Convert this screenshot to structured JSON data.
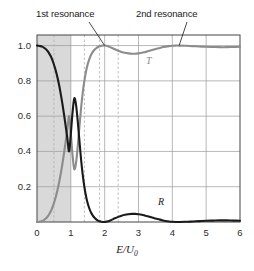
{
  "chart_data": {
    "type": "line",
    "title": "",
    "subtitle": "",
    "xlabel": "E/U_0",
    "xlabel_main": "E/U",
    "xlabel_sub": "0",
    "ylabel": "",
    "xlim": [
      0,
      6
    ],
    "ylim": [
      0,
      1.06
    ],
    "grid": true,
    "grid_x_values": [
      0,
      1,
      2,
      3,
      4,
      5,
      6
    ],
    "grid_y_values": [
      0.2,
      0.4,
      0.6,
      0.8,
      1.0
    ],
    "xticks": [
      0,
      1,
      2,
      3,
      4,
      5,
      6
    ],
    "xtick_labels": [
      "0",
      "1",
      "2",
      "3",
      "4",
      "5",
      "6"
    ],
    "yticks": [
      0.2,
      0.4,
      0.6,
      0.8,
      1.0
    ],
    "ytick_labels": [
      "0.2",
      "0.4",
      "0.6",
      "0.8",
      "1.0"
    ],
    "legend_position": "inline-curve-labels",
    "shaded_region": {
      "label": "bound-region",
      "x_start": 0,
      "x_end": 1,
      "color": "#d9d9d9"
    },
    "dashed_verticals": [
      0.5,
      1.4,
      1.85,
      2.4
    ],
    "series": [
      {
        "name": "T",
        "label": "T",
        "color": "#8c8c8c",
        "points": [
          [
            0.0,
            0.0
          ],
          [
            0.05,
            0.001
          ],
          [
            0.1,
            0.003
          ],
          [
            0.15,
            0.006
          ],
          [
            0.2,
            0.011
          ],
          [
            0.25,
            0.018
          ],
          [
            0.3,
            0.028
          ],
          [
            0.35,
            0.041
          ],
          [
            0.4,
            0.058
          ],
          [
            0.45,
            0.08
          ],
          [
            0.5,
            0.107
          ],
          [
            0.55,
            0.139
          ],
          [
            0.6,
            0.177
          ],
          [
            0.65,
            0.221
          ],
          [
            0.7,
            0.272
          ],
          [
            0.75,
            0.329
          ],
          [
            0.8,
            0.392
          ],
          [
            0.85,
            0.46
          ],
          [
            0.9,
            0.53
          ],
          [
            0.95,
            0.6
          ],
          [
            1.0,
            0.5
          ],
          [
            1.05,
            0.38
          ],
          [
            1.1,
            0.3
          ],
          [
            1.15,
            0.33
          ],
          [
            1.2,
            0.42
          ],
          [
            1.25,
            0.53
          ],
          [
            1.3,
            0.64
          ],
          [
            1.35,
            0.73
          ],
          [
            1.4,
            0.8
          ],
          [
            1.45,
            0.855
          ],
          [
            1.5,
            0.895
          ],
          [
            1.55,
            0.925
          ],
          [
            1.6,
            0.948
          ],
          [
            1.65,
            0.964
          ],
          [
            1.7,
            0.976
          ],
          [
            1.75,
            0.985
          ],
          [
            1.8,
            0.992
          ],
          [
            1.85,
            0.996
          ],
          [
            1.9,
            0.999
          ],
          [
            1.95,
            1.0
          ],
          [
            2.0,
            1.0
          ],
          [
            2.1,
            0.996
          ],
          [
            2.2,
            0.988
          ],
          [
            2.3,
            0.979
          ],
          [
            2.4,
            0.971
          ],
          [
            2.5,
            0.964
          ],
          [
            2.6,
            0.959
          ],
          [
            2.7,
            0.956
          ],
          [
            2.8,
            0.954
          ],
          [
            2.9,
            0.954
          ],
          [
            3.0,
            0.956
          ],
          [
            3.1,
            0.959
          ],
          [
            3.2,
            0.964
          ],
          [
            3.3,
            0.969
          ],
          [
            3.4,
            0.975
          ],
          [
            3.5,
            0.98
          ],
          [
            3.6,
            0.985
          ],
          [
            3.7,
            0.99
          ],
          [
            3.8,
            0.994
          ],
          [
            3.9,
            0.997
          ],
          [
            4.0,
            0.999
          ],
          [
            4.1,
            1.0
          ],
          [
            4.2,
            1.0
          ],
          [
            4.4,
            0.999
          ],
          [
            4.6,
            0.997
          ],
          [
            4.8,
            0.995
          ],
          [
            5.0,
            0.993
          ],
          [
            5.2,
            0.992
          ],
          [
            5.4,
            0.991
          ],
          [
            5.6,
            0.991
          ],
          [
            5.8,
            0.992
          ],
          [
            6.0,
            0.993
          ]
        ]
      },
      {
        "name": "R",
        "label": "R",
        "color": "#1a1a1a",
        "points": [
          [
            0.0,
            1.0
          ],
          [
            0.05,
            0.999
          ],
          [
            0.1,
            0.997
          ],
          [
            0.15,
            0.994
          ],
          [
            0.2,
            0.989
          ],
          [
            0.25,
            0.982
          ],
          [
            0.3,
            0.972
          ],
          [
            0.35,
            0.959
          ],
          [
            0.4,
            0.942
          ],
          [
            0.45,
            0.92
          ],
          [
            0.5,
            0.893
          ],
          [
            0.55,
            0.861
          ],
          [
            0.6,
            0.823
          ],
          [
            0.65,
            0.779
          ],
          [
            0.7,
            0.728
          ],
          [
            0.75,
            0.671
          ],
          [
            0.8,
            0.608
          ],
          [
            0.85,
            0.54
          ],
          [
            0.9,
            0.47
          ],
          [
            0.95,
            0.4
          ],
          [
            1.0,
            0.5
          ],
          [
            1.05,
            0.62
          ],
          [
            1.1,
            0.7
          ],
          [
            1.15,
            0.67
          ],
          [
            1.2,
            0.58
          ],
          [
            1.25,
            0.47
          ],
          [
            1.3,
            0.36
          ],
          [
            1.35,
            0.27
          ],
          [
            1.4,
            0.2
          ],
          [
            1.45,
            0.145
          ],
          [
            1.5,
            0.105
          ],
          [
            1.55,
            0.075
          ],
          [
            1.6,
            0.052
          ],
          [
            1.65,
            0.036
          ],
          [
            1.7,
            0.024
          ],
          [
            1.75,
            0.015
          ],
          [
            1.8,
            0.008
          ],
          [
            1.85,
            0.004
          ],
          [
            1.9,
            0.001
          ],
          [
            1.95,
            0.0
          ],
          [
            2.0,
            0.0
          ],
          [
            2.1,
            0.004
          ],
          [
            2.2,
            0.012
          ],
          [
            2.3,
            0.021
          ],
          [
            2.4,
            0.029
          ],
          [
            2.5,
            0.036
          ],
          [
            2.6,
            0.041
          ],
          [
            2.7,
            0.044
          ],
          [
            2.8,
            0.046
          ],
          [
            2.9,
            0.046
          ],
          [
            3.0,
            0.044
          ],
          [
            3.1,
            0.041
          ],
          [
            3.2,
            0.036
          ],
          [
            3.3,
            0.031
          ],
          [
            3.4,
            0.025
          ],
          [
            3.5,
            0.02
          ],
          [
            3.6,
            0.015
          ],
          [
            3.7,
            0.01
          ],
          [
            3.8,
            0.006
          ],
          [
            3.9,
            0.003
          ],
          [
            4.0,
            0.001
          ],
          [
            4.1,
            0.0
          ],
          [
            4.2,
            0.0
          ],
          [
            4.4,
            0.001
          ],
          [
            4.6,
            0.003
          ],
          [
            4.8,
            0.005
          ],
          [
            5.0,
            0.007
          ],
          [
            5.2,
            0.008
          ],
          [
            5.4,
            0.009
          ],
          [
            5.6,
            0.009
          ],
          [
            5.8,
            0.008
          ],
          [
            6.0,
            0.007
          ]
        ]
      }
    ],
    "annotations": [
      {
        "name": "first-resonance",
        "text": "1st resonance",
        "target_x": 2.0,
        "target_y": 1.0
      },
      {
        "name": "second-resonance",
        "text": "2nd resonance",
        "target_x": 4.2,
        "target_y": 1.0
      }
    ]
  },
  "labels": {
    "annotation_first": "1st resonance",
    "annotation_second": "2nd resonance",
    "curve_T": "T",
    "curve_R": "R",
    "xaxis_main": "E/U",
    "xaxis_sub": "0"
  },
  "colors": {
    "curve_T": "#8c8c8c",
    "curve_R": "#1a1a1a",
    "shaded_region": "#d9d9d9",
    "grid": "#999999",
    "axis": "#555555",
    "dashed": "#b0b0b0",
    "text": "#1a1a1a",
    "background": "#ffffff"
  }
}
